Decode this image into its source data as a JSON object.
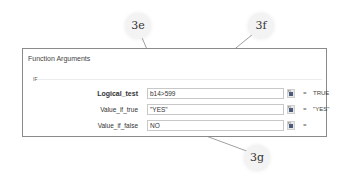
{
  "dialog": {
    "title": "Function Arguments",
    "function_name": "IF",
    "arguments": [
      {
        "label": "Logical_test",
        "value": "b14>599",
        "result": "TRUE",
        "bold": true
      },
      {
        "label": "Value_if_true",
        "value": "\"YES\"",
        "result": "\"YES\"",
        "bold": false
      },
      {
        "label": "Value_if_false",
        "value": "NO",
        "result": "",
        "bold": false
      }
    ],
    "equals_sign": "=",
    "ref_button_icon": "collapse-dialog-icon"
  },
  "callouts": [
    {
      "id": "3e",
      "label": "3e"
    },
    {
      "id": "3f",
      "label": "3f"
    },
    {
      "id": "3g",
      "label": "3g"
    }
  ],
  "colors": {
    "border": "#8a8a8a",
    "input_border": "#c8c8c8",
    "callout_bg": "#f3f3f3"
  }
}
